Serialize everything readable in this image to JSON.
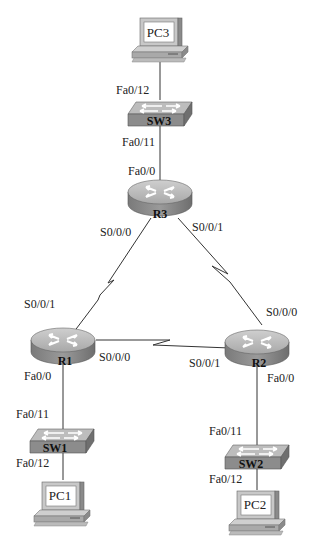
{
  "devices": {
    "pc3": {
      "label": "PC3"
    },
    "sw3": {
      "label": "SW3"
    },
    "r3": {
      "label": "R3"
    },
    "r1": {
      "label": "R1"
    },
    "r2": {
      "label": "R2"
    },
    "sw1": {
      "label": "SW1"
    },
    "sw2": {
      "label": "SW2"
    },
    "pc1": {
      "label": "PC1"
    },
    "pc2": {
      "label": "PC2"
    }
  },
  "interfaces": {
    "sw3_fa0_12": "Fa0/12",
    "sw3_fa0_11": "Fa0/11",
    "r3_fa0_0": "Fa0/0",
    "r3_s0_0_0": "S0/0/0",
    "r3_s0_0_1": "S0/0/1",
    "r1_s0_0_1": "S0/0/1",
    "r1_s0_0_0": "S0/0/0",
    "r1_fa0_0": "Fa0/0",
    "r2_s0_0_0": "S0/0/0",
    "r2_s0_0_1": "S0/0/1",
    "r2_fa0_0": "Fa0/0",
    "sw1_fa0_11": "Fa0/11",
    "sw1_fa0_12": "Fa0/12",
    "sw2_fa0_11": "Fa0/11",
    "sw2_fa0_12": "Fa0/12"
  },
  "colors": {
    "device_top": "#b9b9b9",
    "device_side": "#8a8a8a",
    "link": "#333333",
    "arrow": "#ffffff"
  }
}
